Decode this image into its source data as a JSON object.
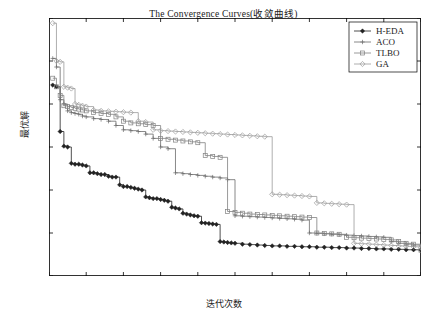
{
  "chart_data": {
    "type": "line",
    "title": "The Convergence Curves(收敛曲线)",
    "xlabel": "迭代次数",
    "ylabel": "最优解",
    "xlim": [
      0,
      100
    ],
    "ylim": [
      500,
      3500
    ],
    "xticks": [
      0,
      10,
      20,
      30,
      40,
      50,
      60,
      70,
      80,
      90,
      100
    ],
    "yticks": [
      500,
      1000,
      1500,
      2000,
      2500,
      3000,
      3500
    ],
    "grid": false,
    "legend_position": "top-right",
    "legend": [
      "H-EDA",
      "ACO",
      "TLBO",
      "GA"
    ],
    "series": [
      {
        "name": "H-EDA",
        "marker": "filled-diamond",
        "color": "#222222",
        "x": [
          1,
          2,
          3,
          4,
          5,
          6,
          7,
          8,
          9,
          10,
          11,
          12,
          13,
          14,
          15,
          16,
          17,
          18,
          19,
          20,
          21,
          22,
          23,
          24,
          25,
          26,
          27,
          28,
          29,
          30,
          31,
          32,
          33,
          34,
          35,
          36,
          37,
          38,
          39,
          40,
          41,
          42,
          43,
          44,
          45,
          46,
          47,
          48,
          49,
          50,
          52,
          54,
          56,
          58,
          60,
          62,
          64,
          66,
          68,
          70,
          72,
          74,
          76,
          78,
          80,
          82,
          84,
          86,
          88,
          90,
          92,
          94,
          96,
          98,
          100
        ],
        "values": [
          2720,
          2700,
          2180,
          2010,
          2000,
          1810,
          1800,
          1800,
          1790,
          1780,
          1700,
          1700,
          1690,
          1680,
          1680,
          1660,
          1650,
          1650,
          1560,
          1540,
          1540,
          1530,
          1520,
          1510,
          1500,
          1420,
          1410,
          1400,
          1400,
          1390,
          1380,
          1370,
          1300,
          1290,
          1280,
          1230,
          1220,
          1210,
          1200,
          1195,
          1120,
          1115,
          1110,
          1105,
          1100,
          900,
          895,
          890,
          885,
          880,
          870,
          865,
          860,
          855,
          850,
          850,
          845,
          845,
          840,
          840,
          835,
          835,
          830,
          830,
          825,
          825,
          820,
          820,
          815,
          815,
          810,
          810,
          805,
          805,
          800
        ]
      },
      {
        "name": "ACO",
        "marker": "plus",
        "color": "#6b6b6b",
        "x": [
          1,
          2,
          3,
          4,
          5,
          6,
          7,
          8,
          9,
          10,
          12,
          14,
          16,
          18,
          20,
          22,
          24,
          26,
          28,
          30,
          32,
          34,
          36,
          38,
          40,
          42,
          44,
          46,
          48,
          50,
          52,
          54,
          56,
          58,
          60,
          62,
          64,
          66,
          68,
          70,
          72,
          74,
          76,
          78,
          80,
          82,
          84,
          86,
          88,
          90,
          92,
          94,
          96,
          98,
          100
        ],
        "values": [
          3030,
          2930,
          2550,
          2500,
          2420,
          2400,
          2390,
          2380,
          2360,
          2350,
          2330,
          2320,
          2300,
          2250,
          2200,
          2190,
          2180,
          2150,
          2100,
          2000,
          1980,
          1700,
          1690,
          1680,
          1670,
          1660,
          1650,
          1640,
          1620,
          1200,
          1195,
          1190,
          1185,
          1180,
          1175,
          1170,
          1165,
          1160,
          1150,
          1000,
          995,
          990,
          985,
          980,
          975,
          970,
          965,
          960,
          955,
          950,
          900,
          880,
          870,
          860,
          850
        ]
      },
      {
        "name": "TLBO",
        "marker": "open-square",
        "color": "#808080",
        "x": [
          1,
          2,
          3,
          4,
          5,
          6,
          7,
          8,
          9,
          10,
          12,
          14,
          16,
          18,
          20,
          22,
          24,
          26,
          28,
          30,
          32,
          34,
          36,
          38,
          40,
          42,
          44,
          46,
          48,
          50,
          52,
          54,
          56,
          58,
          60,
          62,
          64,
          66,
          68,
          70,
          72,
          74,
          76,
          78,
          80,
          82,
          84,
          86,
          88,
          90,
          92,
          94,
          96,
          98,
          100
        ],
        "values": [
          2800,
          2700,
          2600,
          2480,
          2470,
          2460,
          2450,
          2440,
          2430,
          2420,
          2400,
          2390,
          2380,
          2350,
          2300,
          2280,
          2270,
          2260,
          2250,
          2100,
          2090,
          2080,
          2070,
          2060,
          2050,
          1900,
          1890,
          1880,
          1250,
          1240,
          1230,
          1220,
          1215,
          1210,
          1205,
          1200,
          1195,
          1190,
          1185,
          1180,
          1000,
          995,
          990,
          985,
          950,
          945,
          940,
          935,
          930,
          925,
          920,
          900,
          880,
          870,
          800
        ]
      },
      {
        "name": "GA",
        "marker": "open-diamond",
        "color": "#9a9a9a",
        "x": [
          1,
          2,
          3,
          4,
          5,
          6,
          7,
          8,
          9,
          10,
          12,
          14,
          16,
          18,
          20,
          22,
          24,
          26,
          28,
          30,
          32,
          34,
          36,
          38,
          40,
          42,
          44,
          46,
          48,
          50,
          52,
          54,
          56,
          58,
          60,
          62,
          64,
          66,
          68,
          70,
          72,
          74,
          76,
          78,
          80,
          82,
          84,
          86,
          88,
          90,
          92,
          94,
          96,
          98,
          100
        ],
        "values": [
          3440,
          3000,
          2990,
          2700,
          2690,
          2680,
          2500,
          2490,
          2480,
          2470,
          2430,
          2420,
          2415,
          2410,
          2405,
          2400,
          2300,
          2290,
          2200,
          2190,
          2185,
          2180,
          2175,
          2170,
          2165,
          2160,
          2155,
          2150,
          2145,
          2140,
          2135,
          2130,
          2125,
          2120,
          1450,
          1445,
          1440,
          1435,
          1430,
          1425,
          1350,
          1345,
          1340,
          1335,
          1330,
          880,
          875,
          870,
          865,
          860,
          855,
          850,
          845,
          840,
          830
        ]
      }
    ]
  }
}
